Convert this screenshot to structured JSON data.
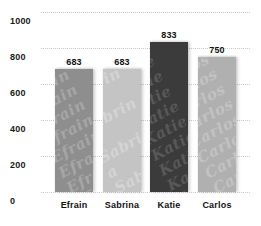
{
  "chart_data": {
    "type": "bar",
    "title": "",
    "xlabel": "",
    "ylabel": "",
    "categories": [
      "Efrain",
      "Sabrina",
      "Katie",
      "Carlos"
    ],
    "values": [
      683,
      683,
      833,
      750
    ],
    "value_labels": [
      "683",
      "683",
      "833",
      "750"
    ],
    "ylim": [
      0,
      1000
    ],
    "ytick_labels": [
      "1000",
      "800",
      "600",
      "400",
      "200",
      "0"
    ],
    "ytick_values": [
      1000,
      800,
      600,
      400,
      200,
      0
    ],
    "grid": true,
    "grid_style": "dotted",
    "legend": "none",
    "bar_watermarks": [
      "Efrain",
      "Sabrina",
      "Katie",
      "Carlos"
    ],
    "bar_colors": [
      "#8e8e8e",
      "#c4c4c4",
      "#3b3b3b",
      "#b0b0b0"
    ],
    "bar_watermark_colors": [
      "#a6a6a6",
      "#d4d4d4",
      "#585858",
      "#c2c2c2"
    ],
    "background_color": "#ffffff",
    "grid_color": "#c9c9c9",
    "text_color": "#111111"
  }
}
